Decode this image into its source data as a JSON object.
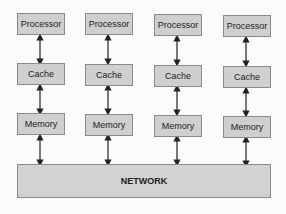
{
  "diagram": {
    "type": "distributed-memory-architecture",
    "columns": [
      {
        "processor": "Processor",
        "cache": "Cache",
        "memory": "Memory"
      },
      {
        "processor": "Processor",
        "cache": "Cache",
        "memory": "Memory"
      },
      {
        "processor": "Processor",
        "cache": "Cache",
        "memory": "Memory"
      },
      {
        "processor": "Processor",
        "cache": "Cache",
        "memory": "Memory"
      }
    ],
    "network_label": "NETWORK",
    "colors": {
      "box_fill": "#cfcfcf",
      "box_border": "#8a8a8a",
      "arrow": "#222222"
    }
  }
}
